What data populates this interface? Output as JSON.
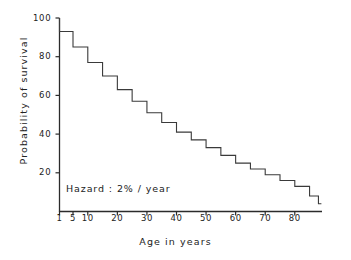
{
  "chart_data": {
    "type": "line",
    "subtype": "step-post",
    "title": "",
    "xlabel": "Age in years",
    "ylabel": "Probability of survival",
    "annotation": "Hazard : 2% / year",
    "grid": false,
    "legend": null,
    "xlim": [
      1,
      88
    ],
    "ylim": [
      0,
      100
    ],
    "x_tick_labels": [
      "1",
      "5",
      "10",
      "20",
      "30",
      "40",
      "50",
      "60",
      "70",
      "80"
    ],
    "x_ticks": [
      1,
      5,
      10,
      20,
      30,
      40,
      50,
      60,
      70,
      80
    ],
    "y_tick_labels": [
      "20",
      "40",
      "60",
      "80",
      "100"
    ],
    "y_ticks": [
      20,
      40,
      60,
      80,
      100
    ],
    "x": [
      1,
      5,
      10,
      15,
      20,
      25,
      30,
      35,
      40,
      45,
      50,
      55,
      60,
      65,
      70,
      75,
      80,
      85,
      88
    ],
    "values": [
      93,
      85,
      77,
      70,
      63,
      57,
      51,
      46,
      41,
      37,
      33,
      29,
      25,
      22,
      19,
      16,
      13,
      8,
      4
    ],
    "series": [
      {
        "name": "Probability of survival",
        "x": [
          1,
          5,
          10,
          15,
          20,
          25,
          30,
          35,
          40,
          45,
          50,
          55,
          60,
          65,
          70,
          75,
          80,
          85,
          88
        ],
        "values": [
          93,
          85,
          77,
          70,
          63,
          57,
          51,
          46,
          41,
          37,
          33,
          29,
          25,
          22,
          19,
          16,
          13,
          8,
          4
        ]
      }
    ],
    "line_color": "#3a3a3a"
  },
  "axes": {
    "x_title": "Age in years",
    "y_title": "Probability of survival"
  },
  "annotations": {
    "hazard": "Hazard : 2% / year"
  },
  "yticks": [
    {
      "value": 100,
      "label": "100"
    },
    {
      "value": 80,
      "label": "80"
    },
    {
      "value": 60,
      "label": "60"
    },
    {
      "value": 40,
      "label": "40"
    },
    {
      "value": 20,
      "label": "20"
    }
  ],
  "xticks": [
    {
      "value": 1,
      "label": "1"
    },
    {
      "value": 5,
      "label": "5"
    },
    {
      "value": 10,
      "label": "10"
    },
    {
      "value": 20,
      "label": "20"
    },
    {
      "value": 30,
      "label": "30"
    },
    {
      "value": 40,
      "label": "40"
    },
    {
      "value": 50,
      "label": "50"
    },
    {
      "value": 60,
      "label": "60"
    },
    {
      "value": 70,
      "label": "70"
    },
    {
      "value": 80,
      "label": "80"
    }
  ]
}
